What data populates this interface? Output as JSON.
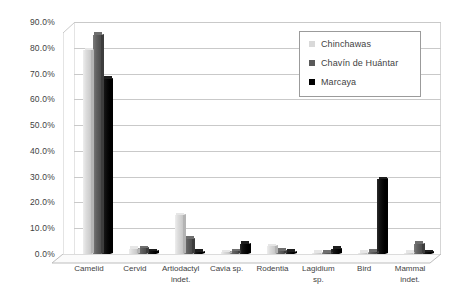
{
  "chart_data": {
    "type": "bar",
    "title": "",
    "subtitle": "",
    "xlabel": "",
    "ylabel": "",
    "ylim": [
      0,
      90
    ],
    "ytick_labels": [
      "0.0%",
      "10.0%",
      "20.0%",
      "30.0%",
      "40.0%",
      "50.0%",
      "60.0%",
      "70.0%",
      "80.0%",
      "90.0%"
    ],
    "ytick_values": [
      0,
      10,
      20,
      30,
      40,
      50,
      60,
      70,
      80,
      90
    ],
    "grid": true,
    "legend_position": "top-right",
    "style": "3d-column",
    "categories": [
      "Camelid",
      "Cervid",
      "Artiodactyl\nindet.",
      "Cavia sp.",
      "Rodentia",
      "Lagidium\nsp.",
      "Bird",
      "Mammal\nindet."
    ],
    "series": [
      {
        "name": "Chinchawas",
        "color": "#d9d9d9",
        "values": [
          79.0,
          2.0,
          15.0,
          0.6,
          3.0,
          0.4,
          0.3,
          0.4
        ]
      },
      {
        "name": "Chavín de Huántar",
        "color": "#595959",
        "values": [
          85.0,
          2.2,
          6.0,
          1.0,
          1.2,
          0.5,
          0.8,
          4.0
        ]
      },
      {
        "name": "Marcaya",
        "color": "#000000",
        "values": [
          68.0,
          1.0,
          0.8,
          4.0,
          0.8,
          2.0,
          29.0,
          0.6
        ]
      }
    ]
  }
}
